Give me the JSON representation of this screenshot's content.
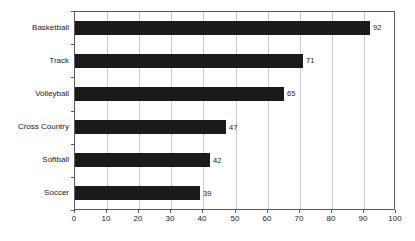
{
  "chart_data": {
    "type": "bar",
    "orientation": "horizontal",
    "title": "",
    "xlabel": "",
    "ylabel": "",
    "categories": [
      "Basketball",
      "Track",
      "Volleyball",
      "Cross Country",
      "Softball",
      "Soccer"
    ],
    "values": [
      92,
      71,
      65,
      47,
      42,
      39
    ],
    "value_labels": [
      "92",
      "71",
      "65",
      "47",
      "42",
      "39"
    ],
    "xlim": [
      0,
      100
    ],
    "x_ticks": [
      0,
      10,
      20,
      30,
      40,
      50,
      60,
      70,
      80,
      90,
      100
    ],
    "x_tick_labels": [
      "0",
      "10",
      "20",
      "30",
      "40",
      "50",
      "60",
      "70",
      "80",
      "90",
      "100"
    ],
    "grid": true,
    "legend": false,
    "colors": {
      "bar": "#1a1a1a",
      "gridline": "#c9c9c9",
      "plot_border": "#595959",
      "text": "#1a1a1a",
      "background": "#ffffff"
    }
  }
}
